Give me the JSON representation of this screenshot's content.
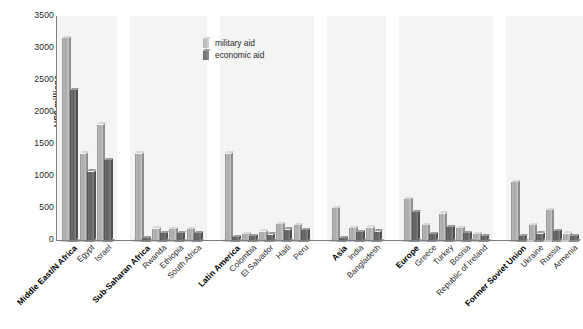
{
  "chart_data": {
    "type": "bar",
    "title": "",
    "xlabel": "",
    "ylabel": "US$ millions",
    "ylim": [
      0,
      3500
    ],
    "yticks": [
      0,
      500,
      1000,
      1500,
      2000,
      2500,
      3000,
      3500
    ],
    "grid": false,
    "legend_position": "top-center",
    "series": [
      {
        "name": "military aid",
        "color": "#b9b9b9"
      },
      {
        "name": "economic aid",
        "color": "#6f6f6f"
      }
    ],
    "groups": [
      {
        "name": "Middle East/N Africa",
        "categories": [
          "Middle East/N Africa",
          "Egypt",
          "Israel"
        ],
        "military_aid": [
          3150,
          1350,
          1800
        ],
        "economic_aid": [
          2340,
          1070,
          1250
        ]
      },
      {
        "name": "Sub-Saharan Africa",
        "categories": [
          "Sub-Saharan Africa",
          "Rwanda",
          "Ethiopia",
          "South Africa"
        ],
        "military_aid": [
          1350,
          175,
          170,
          165
        ],
        "economic_aid": [
          30,
          110,
          110,
          105
        ]
      },
      {
        "name": "Latin America",
        "categories": [
          "Latin America",
          "Colombia",
          "El Salvador",
          "Haiti",
          "Peru"
        ],
        "military_aid": [
          1350,
          90,
          130,
          250,
          235
        ],
        "economic_aid": [
          40,
          60,
          85,
          160,
          150
        ]
      },
      {
        "name": "Asia",
        "categories": [
          "Asia",
          "India",
          "Bangladesh"
        ],
        "military_aid": [
          500,
          180,
          195
        ],
        "economic_aid": [
          30,
          120,
          130
        ]
      },
      {
        "name": "Europe",
        "categories": [
          "Europe",
          "Greece",
          "Turkey",
          "Bosnia",
          "Republic of Ireland"
        ],
        "military_aid": [
          640,
          230,
          410,
          185,
          95
        ],
        "economic_aid": [
          430,
          95,
          200,
          110,
          60
        ]
      },
      {
        "name": "Former Soviet Union",
        "categories": [
          "Former Soviet Union",
          "Ukraine",
          "Russia",
          "Armenia"
        ],
        "military_aid": [
          900,
          230,
          470,
          100
        ],
        "economic_aid": [
          60,
          100,
          140,
          55
        ]
      }
    ]
  },
  "legend": {
    "items": [
      {
        "label": "military aid"
      },
      {
        "label": "economic aid"
      }
    ]
  },
  "axis": {
    "y_title": "US$ millions",
    "y_tick_labels": [
      "3500",
      "3000",
      "2500",
      "2000",
      "1500",
      "1000",
      "500",
      "0"
    ]
  }
}
